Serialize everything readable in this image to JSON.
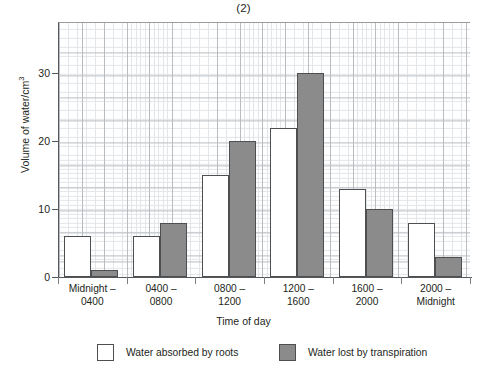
{
  "chart_data": {
    "type": "bar",
    "title": "(2)",
    "xlabel": "Time of day",
    "ylabel": "Volume of water/cm",
    "ylabel_superscript": "3",
    "categories": [
      "Midnight –\n0400",
      "0400 –\n0800",
      "0800 –\n1200",
      "1200 –\n1600",
      "1600 –\n2000",
      "2000 –\nMidnight"
    ],
    "category_lines": [
      [
        "Midnight –",
        "0400"
      ],
      [
        "0400 –",
        "0800"
      ],
      [
        "0800 –",
        "1200"
      ],
      [
        "1200 –",
        "1600"
      ],
      [
        "1600 –",
        "2000"
      ],
      [
        "2000 –",
        "Midnight"
      ]
    ],
    "series": [
      {
        "name": "Water absorbed by roots",
        "color": "#ffffff",
        "values": [
          6,
          6,
          15,
          22,
          13,
          8
        ]
      },
      {
        "name": "Water lost by transpiration",
        "color": "#8b8b8b",
        "values": [
          1,
          8,
          20,
          30,
          10,
          3
        ]
      }
    ],
    "ylim": [
      0,
      37.5
    ],
    "yticks": [
      0,
      10,
      20,
      30
    ],
    "ytick_labels": [
      "0",
      "10",
      "20",
      "30"
    ],
    "grid": true,
    "grid_minor": true,
    "legend_position": "below"
  },
  "legend": {
    "items": [
      {
        "label": "Water absorbed by roots",
        "swatch": "absorbed"
      },
      {
        "label": "Water lost by transpiration",
        "swatch": "transpired"
      }
    ]
  },
  "colors": {
    "bar_fill_absorbed": "#ffffff",
    "bar_fill_transpired": "#8b8b8b",
    "bar_outline": "#4d4f51",
    "axis": "#55585a",
    "grid_major": "#b9bdc2",
    "grid_minor": "#e3e6e9",
    "text": "#231f20"
  }
}
